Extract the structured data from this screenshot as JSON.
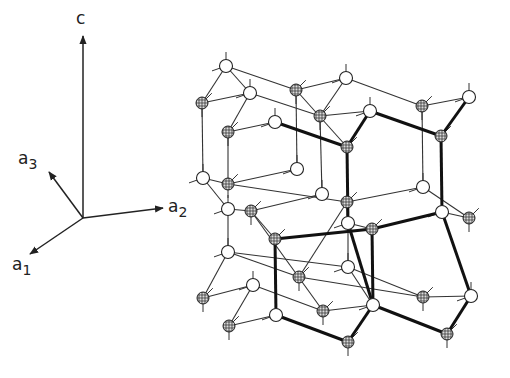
{
  "axes": {
    "origin": [
      83,
      218
    ],
    "vectors": [
      {
        "name": "c",
        "to": [
          83,
          36
        ],
        "label": "c",
        "sub": "",
        "label_pos": [
          76,
          10
        ]
      },
      {
        "name": "a3",
        "to": [
          49,
          172
        ],
        "label": "a",
        "sub": "3",
        "label_pos": [
          18,
          150
        ]
      },
      {
        "name": "a2",
        "to": [
          163,
          208
        ],
        "label": "a",
        "sub": "2",
        "label_pos": [
          168,
          198
        ]
      },
      {
        "name": "a1",
        "to": [
          30,
          254
        ],
        "label": "a",
        "sub": "1",
        "label_pos": [
          12,
          256
        ]
      }
    ]
  },
  "atoms": [
    {
      "id": "A1",
      "x": 226,
      "y": 66,
      "type": "white"
    },
    {
      "id": "A2",
      "x": 202,
      "y": 103,
      "type": "shaded"
    },
    {
      "id": "A3",
      "x": 250,
      "y": 93,
      "type": "white"
    },
    {
      "id": "A4",
      "x": 296,
      "y": 90,
      "type": "shaded"
    },
    {
      "id": "A5",
      "x": 346,
      "y": 78,
      "type": "white"
    },
    {
      "id": "A6",
      "x": 228,
      "y": 132,
      "type": "shaded"
    },
    {
      "id": "A7",
      "x": 275,
      "y": 122,
      "type": "white"
    },
    {
      "id": "A8",
      "x": 320,
      "y": 116,
      "type": "shaded"
    },
    {
      "id": "A9",
      "x": 370,
      "y": 111,
      "type": "white"
    },
    {
      "id": "A10",
      "x": 422,
      "y": 106,
      "type": "shaded"
    },
    {
      "id": "A11",
      "x": 469,
      "y": 97,
      "type": "white"
    },
    {
      "id": "A12",
      "x": 347,
      "y": 147,
      "type": "shaded"
    },
    {
      "id": "A13",
      "x": 441,
      "y": 136,
      "type": "shaded"
    },
    {
      "id": "A14",
      "x": 297,
      "y": 169,
      "type": "white"
    },
    {
      "id": "A15",
      "x": 203,
      "y": 178,
      "type": "white"
    },
    {
      "id": "A16",
      "x": 228,
      "y": 184,
      "type": "shaded"
    },
    {
      "id": "A17",
      "x": 423,
      "y": 187,
      "type": "white"
    },
    {
      "id": "A18",
      "x": 322,
      "y": 194,
      "type": "white"
    },
    {
      "id": "A19",
      "x": 347,
      "y": 202,
      "type": "shaded"
    },
    {
      "id": "A20",
      "x": 228,
      "y": 209,
      "type": "white"
    },
    {
      "id": "A21",
      "x": 251,
      "y": 211,
      "type": "shaded"
    },
    {
      "id": "A22",
      "x": 442,
      "y": 212,
      "type": "white"
    },
    {
      "id": "A23",
      "x": 469,
      "y": 218,
      "type": "shaded"
    },
    {
      "id": "A24",
      "x": 348,
      "y": 223,
      "type": "white"
    },
    {
      "id": "A25",
      "x": 372,
      "y": 229,
      "type": "shaded"
    },
    {
      "id": "A26",
      "x": 275,
      "y": 239,
      "type": "shaded"
    },
    {
      "id": "A27",
      "x": 228,
      "y": 252,
      "type": "white"
    },
    {
      "id": "A28",
      "x": 348,
      "y": 267,
      "type": "white"
    },
    {
      "id": "A29",
      "x": 299,
      "y": 277,
      "type": "shaded"
    },
    {
      "id": "A30",
      "x": 253,
      "y": 285,
      "type": "white"
    },
    {
      "id": "A31",
      "x": 423,
      "y": 297,
      "type": "shaded"
    },
    {
      "id": "A32",
      "x": 471,
      "y": 296,
      "type": "white"
    },
    {
      "id": "A33",
      "x": 203,
      "y": 298,
      "type": "shaded"
    },
    {
      "id": "A34",
      "x": 373,
      "y": 305,
      "type": "white"
    },
    {
      "id": "A35",
      "x": 323,
      "y": 311,
      "type": "shaded"
    },
    {
      "id": "A36",
      "x": 276,
      "y": 315,
      "type": "white"
    },
    {
      "id": "A37",
      "x": 229,
      "y": 326,
      "type": "shaded"
    },
    {
      "id": "A38",
      "x": 447,
      "y": 334,
      "type": "shaded"
    },
    {
      "id": "A39",
      "x": 348,
      "y": 342,
      "type": "shaded"
    }
  ],
  "bonds": [
    [
      "A1",
      "A2"
    ],
    [
      "A1",
      "A3"
    ],
    [
      "A1",
      "A4"
    ],
    [
      "A4",
      "A5"
    ],
    [
      "A4",
      "A12"
    ],
    [
      "A5",
      "A10"
    ],
    [
      "A5",
      "A8"
    ],
    [
      "A2",
      "A3"
    ],
    [
      "A3",
      "A6"
    ],
    [
      "A3",
      "A8"
    ],
    [
      "A6",
      "A7"
    ],
    [
      "A2",
      "A15"
    ],
    [
      "A6",
      "A16"
    ],
    [
      "A8",
      "A9"
    ],
    [
      "A10",
      "A11"
    ],
    [
      "A10",
      "A17"
    ],
    [
      "A9",
      "A13"
    ],
    [
      "A11",
      "A13"
    ],
    [
      "A15",
      "A16"
    ],
    [
      "A15",
      "A20"
    ],
    [
      "A16",
      "A14"
    ],
    [
      "A14",
      "A4"
    ],
    [
      "A16",
      "A19"
    ],
    [
      "A20",
      "A21"
    ],
    [
      "A21",
      "A18"
    ],
    [
      "A18",
      "A8"
    ],
    [
      "A19",
      "A17"
    ],
    [
      "A17",
      "A23"
    ],
    [
      "A21",
      "A26"
    ],
    [
      "A20",
      "A27"
    ],
    [
      "A19",
      "A24"
    ],
    [
      "A24",
      "A25"
    ],
    [
      "A22",
      "A23"
    ],
    [
      "A27",
      "A33"
    ],
    [
      "A27",
      "A28"
    ],
    [
      "A27",
      "A29"
    ],
    [
      "A30",
      "A33"
    ],
    [
      "A30",
      "A37"
    ],
    [
      "A30",
      "A35"
    ],
    [
      "A21",
      "A35"
    ],
    [
      "A28",
      "A31"
    ],
    [
      "A28",
      "A34"
    ],
    [
      "A24",
      "A28"
    ],
    [
      "A31",
      "A32"
    ],
    [
      "A26",
      "A36"
    ],
    [
      "A29",
      "A31"
    ],
    [
      "A36",
      "A37"
    ],
    [
      "A34",
      "A35"
    ],
    [
      "A19",
      "A29"
    ]
  ],
  "heavy_bonds": [
    [
      "A7",
      "A12"
    ],
    [
      "A12",
      "A24"
    ],
    [
      "A12",
      "A9"
    ],
    [
      "A9",
      "A13"
    ],
    [
      "A13",
      "A11"
    ],
    [
      "A13",
      "A22"
    ],
    [
      "A22",
      "A25"
    ],
    [
      "A25",
      "A26"
    ],
    [
      "A26",
      "A36"
    ],
    [
      "A36",
      "A39"
    ],
    [
      "A25",
      "A34"
    ],
    [
      "A34",
      "A39"
    ],
    [
      "A22",
      "A32"
    ],
    [
      "A32",
      "A38"
    ],
    [
      "A38",
      "A34"
    ],
    [
      "A24",
      "A34"
    ]
  ],
  "stubs_note": "short dangling bond stubs extend from atoms"
}
